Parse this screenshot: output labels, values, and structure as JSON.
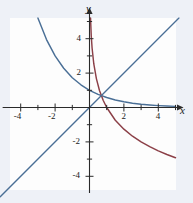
{
  "figure": {
    "name": "inverse-function-graph",
    "background_color": "#eef1f7",
    "panel_color": "#fdfdfd"
  },
  "axes": {
    "x_axis_label": "x",
    "y_axis_label": "y",
    "axis_color": "#2a2a2a",
    "x_tick_labels": [
      "-4",
      "-2",
      "2",
      "4"
    ],
    "y_tick_labels": [
      "4",
      "2",
      "-2",
      "-4"
    ]
  },
  "chart_data": {
    "type": "line",
    "title": "",
    "xlabel": "x",
    "ylabel": "y",
    "xlim": [
      -5.2,
      5.2
    ],
    "ylim": [
      -5.2,
      5.2
    ],
    "xticks": [
      -4,
      -2,
      2,
      4
    ],
    "yticks": [
      -4,
      -2,
      2,
      4
    ],
    "grid": false,
    "legend": "none",
    "series": [
      {
        "name": "exponential-decay-curve",
        "color": "#4a6f96",
        "x": [
          -3.0,
          -2.5,
          -2.0,
          -1.5,
          -1.0,
          -0.5,
          0.0,
          0.5,
          1.0,
          1.5,
          2.0,
          2.5,
          3.0,
          3.5,
          4.0,
          4.5,
          5.0
        ],
        "y": [
          5.2,
          3.95,
          3.0,
          2.28,
          1.73,
          1.32,
          1.0,
          0.76,
          0.58,
          0.44,
          0.33,
          0.25,
          0.19,
          0.145,
          0.11,
          0.084,
          0.064
        ]
      },
      {
        "name": "logarithmic-curve",
        "color": "#8b3f47",
        "x": [
          0.06,
          0.1,
          0.15,
          0.25,
          0.4,
          0.58,
          0.8,
          1.0,
          1.5,
          2.0,
          2.5,
          3.0,
          3.5,
          4.0,
          4.5,
          5.0
        ],
        "y": [
          5.2,
          4.2,
          3.46,
          2.53,
          1.68,
          0.99,
          0.41,
          0.0,
          -0.74,
          -1.26,
          -1.67,
          -2.0,
          -2.28,
          -2.52,
          -2.73,
          -2.92
        ]
      },
      {
        "name": "identity-line",
        "color": "#4a6f96",
        "x": [
          -5.2,
          5.2
        ],
        "y": [
          -5.2,
          5.2
        ]
      }
    ]
  }
}
